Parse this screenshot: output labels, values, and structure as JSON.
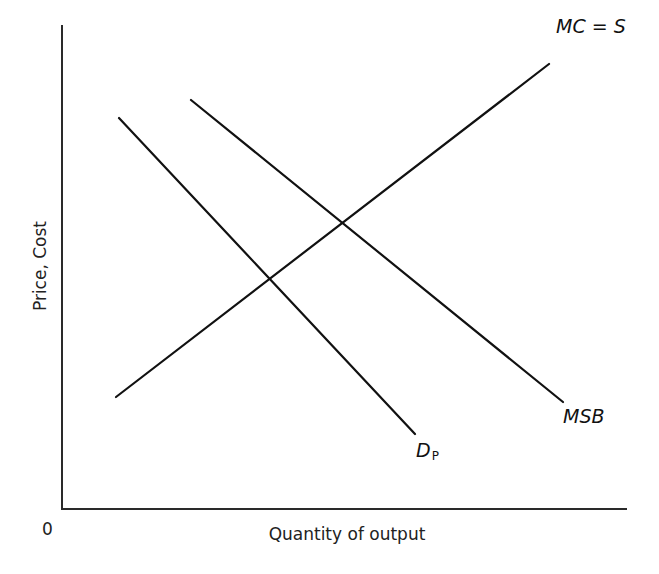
{
  "diagram": {
    "type": "supply-demand",
    "origin_label": "0",
    "axes": {
      "x_label": "Quantity of output",
      "y_label": "Price, Cost"
    },
    "curves": [
      {
        "id": "mc",
        "label": "MC = S",
        "label_main": "MC = S",
        "label_sub": "",
        "slope": "upward",
        "color": "#111111"
      },
      {
        "id": "dp",
        "label": "DP",
        "label_main": "D",
        "label_sub": "P",
        "slope": "downward",
        "color": "#111111"
      },
      {
        "id": "msb",
        "label": "MSB",
        "label_main": "MSB",
        "label_sub": "",
        "slope": "downward",
        "color": "#111111"
      }
    ],
    "intersections": [
      {
        "curves": [
          "dp",
          "mc"
        ],
        "description": "private market equilibrium"
      },
      {
        "curves": [
          "msb",
          "mc"
        ],
        "description": "socially optimal equilibrium"
      }
    ]
  }
}
